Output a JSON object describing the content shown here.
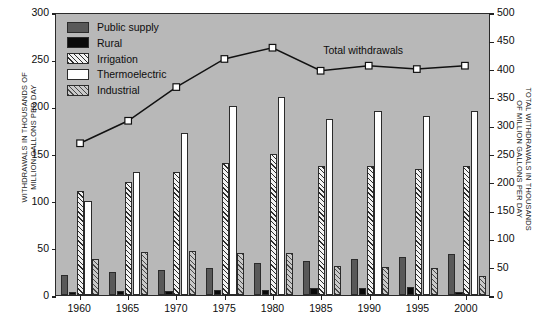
{
  "chart_data": {
    "type": "bar",
    "title": "",
    "subtitle": "",
    "xlabel": "",
    "ylabel": "WITHDRAWALS IN THOUSANDS OF\nMILLION GALLONS PER DAY",
    "ylabel_right": "TOTAL WITHDRAWALS IN THOUSANDS\nOF MILLION GALLONS PER DAY",
    "categories": [
      "1960",
      "1965",
      "1970",
      "1975",
      "1980",
      "1985",
      "1990",
      "1995",
      "2000"
    ],
    "ylim": [
      0,
      300
    ],
    "yticks": [
      "0",
      "50",
      "100",
      "150",
      "200",
      "250",
      "300"
    ],
    "ylim_right": [
      0,
      500
    ],
    "yticks_right": [
      "0",
      "50",
      "100",
      "150",
      "200",
      "250",
      "300",
      "350",
      "400",
      "450",
      "500"
    ],
    "grid": false,
    "legend_position": "upper-left",
    "series": [
      {
        "name": "Public supply",
        "swatch": "sw-public",
        "values": [
          21,
          24,
          27,
          29,
          34,
          36.5,
          38.5,
          40.2,
          43.3
        ]
      },
      {
        "name": "Rural",
        "swatch": "sw-rural",
        "values": [
          3.6,
          4.0,
          4.5,
          4.9,
          5.6,
          7.8,
          7.9,
          8.9,
          3.6
        ]
      },
      {
        "name": "Irrigation",
        "swatch": "sw-irrigation",
        "values": [
          110,
          120,
          130,
          140,
          150,
          137,
          137,
          134,
          137
        ]
      },
      {
        "name": "Thermoelectric",
        "swatch": "sw-thermo",
        "values": [
          100,
          130,
          172,
          200,
          210,
          187,
          195,
          190,
          195
        ]
      },
      {
        "name": "Industrial",
        "swatch": "sw-industrial",
        "values": [
          38,
          46,
          47,
          45,
          45,
          30.5,
          29.9,
          29.1,
          19.7
        ]
      }
    ],
    "line_series": {
      "name": "Total withdrawals",
      "axis": "right",
      "values": [
        270,
        310,
        370,
        420,
        440,
        399,
        408,
        402,
        408
      ],
      "marker": "square-open"
    },
    "colors": {
      "plot_background": "#b8b8b8",
      "axis": "#2a2a2a",
      "public_supply": "#595959",
      "rural": "#0a0a0a",
      "thermoelectric": "#ffffff",
      "line": "#111111"
    }
  },
  "annotations": {
    "total_withdrawals_label": "Total withdrawals"
  }
}
